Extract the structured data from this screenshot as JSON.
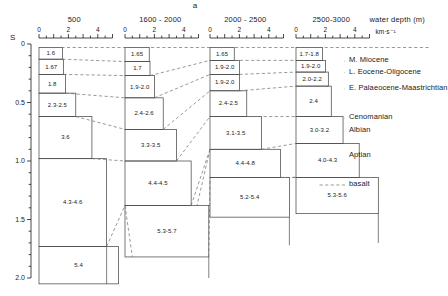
{
  "figure": {
    "top_mark": "a",
    "y_axis": {
      "label": "S",
      "ticks": [
        "0",
        "0.5",
        "1.0",
        "1.5",
        "2.0"
      ],
      "tick_values": [
        0,
        0.5,
        1.0,
        1.5,
        2.0
      ],
      "minor_step": 0.1
    },
    "velocity_axis": {
      "ticks": [
        "0",
        "2",
        "4"
      ],
      "unit": "km·s⁻¹",
      "minor_step": 0.5,
      "range": [
        0,
        5
      ]
    },
    "columns": [
      {
        "header": "500",
        "boxes": [
          {
            "label": "1.6",
            "top": 0.03,
            "bottom": 0.13,
            "vmin": 0,
            "vmax": 1.6
          },
          {
            "label": "1.67",
            "top": 0.13,
            "bottom": 0.26,
            "vmin": 0,
            "vmax": 1.67
          },
          {
            "label": "1.8",
            "top": 0.26,
            "bottom": 0.42,
            "vmin": 0,
            "vmax": 1.8
          },
          {
            "label": "2.3-2.5",
            "top": 0.42,
            "bottom": 0.62,
            "vmin": 0,
            "vmax": 2.5
          },
          {
            "label": "3.6",
            "top": 0.62,
            "bottom": 0.98,
            "vmin": 0,
            "vmax": 3.6
          },
          {
            "label": "4.3-4.6",
            "top": 0.98,
            "bottom": 1.73,
            "vmin": 0,
            "vmax": 4.6
          },
          {
            "label": "5.4",
            "top": 1.73,
            "bottom": 2.05,
            "vmin": 0,
            "vmax": 5.4
          }
        ]
      },
      {
        "header": "1600 - 2000",
        "boxes": [
          {
            "label": "1.65",
            "top": 0.03,
            "bottom": 0.15,
            "vmin": 0,
            "vmax": 1.65
          },
          {
            "label": "1.7",
            "top": 0.15,
            "bottom": 0.27,
            "vmin": 0,
            "vmax": 1.7
          },
          {
            "label": "1.9-2.0",
            "top": 0.27,
            "bottom": 0.46,
            "vmin": 0,
            "vmax": 2.0
          },
          {
            "label": "2.4-2.6",
            "top": 0.46,
            "bottom": 0.73,
            "vmin": 0,
            "vmax": 2.6
          },
          {
            "label": "3.3-3.5",
            "top": 0.73,
            "bottom": 1.0,
            "vmin": 0,
            "vmax": 3.5
          },
          {
            "label": "4.4-4.5",
            "top": 1.0,
            "bottom": 1.38,
            "vmin": 0,
            "vmax": 4.5
          },
          {
            "label": "5.3-5.7",
            "top": 1.38,
            "bottom": 1.82,
            "vmin": 0,
            "vmax": 5.7
          }
        ]
      },
      {
        "header": "2000 - 2500",
        "boxes": [
          {
            "label": "1.65",
            "top": 0.03,
            "bottom": 0.14,
            "vmin": 0,
            "vmax": 1.65
          },
          {
            "label": "1.9-2.0",
            "top": 0.14,
            "bottom": 0.26,
            "vmin": 0,
            "vmax": 2.0
          },
          {
            "label": "1.9-2.0",
            "top": 0.26,
            "bottom": 0.4,
            "vmin": 0,
            "vmax": 2.0
          },
          {
            "label": "2.4-2.5",
            "top": 0.4,
            "bottom": 0.62,
            "vmin": 0,
            "vmax": 2.5
          },
          {
            "label": "3.1-3.5",
            "top": 0.62,
            "bottom": 0.9,
            "vmin": 0,
            "vmax": 3.5
          },
          {
            "label": "4.4-4.8",
            "top": 0.9,
            "bottom": 1.14,
            "vmin": 0,
            "vmax": 4.8
          },
          {
            "label": "5.2-5.4",
            "top": 1.14,
            "bottom": 1.48,
            "vmin": 0,
            "vmax": 5.4
          }
        ]
      },
      {
        "header": "2500-3000",
        "header_suffix": "water depth (m)",
        "boxes": [
          {
            "label": "1.7-1.8",
            "top": 0.03,
            "bottom": 0.14,
            "vmin": 0,
            "vmax": 1.8
          },
          {
            "label": "1.9-2.0",
            "top": 0.14,
            "bottom": 0.24,
            "vmin": 0,
            "vmax": 2.0
          },
          {
            "label": "2.0-2.2",
            "top": 0.24,
            "bottom": 0.36,
            "vmin": 0,
            "vmax": 2.2
          },
          {
            "label": "2.4",
            "top": 0.36,
            "bottom": 0.62,
            "vmin": 0,
            "vmax": 2.4
          },
          {
            "label": "3.0-3.2",
            "top": 0.62,
            "bottom": 0.85,
            "vmin": 0,
            "vmax": 3.2
          },
          {
            "label": "4.0-4.3",
            "top": 0.85,
            "bottom": 1.14,
            "vmin": 0,
            "vmax": 4.3
          },
          {
            "label": "5.3-5.6",
            "top": 1.14,
            "bottom": 1.45,
            "vmin": 0,
            "vmax": 5.6
          }
        ]
      }
    ],
    "strat_labels": [
      {
        "text": "M. Miocene",
        "y": 0.145
      },
      {
        "text": "L. Eocene-Oligocene",
        "y": 0.245
      },
      {
        "text": "E. Palaeocene-Maastrichtian",
        "y": 0.385
      },
      {
        "text": "Cenomanian",
        "y": 0.635
      },
      {
        "text": "Albian",
        "y": 0.745
      },
      {
        "text": "Aptian",
        "y": 0.955
      },
      {
        "text": "basalt",
        "y": 1.205
      }
    ],
    "colors": {
      "ink": "#1a1a1a",
      "line": "#4a4a4a",
      "dashed": "#6e6e6e",
      "background": "#ffffff"
    }
  }
}
